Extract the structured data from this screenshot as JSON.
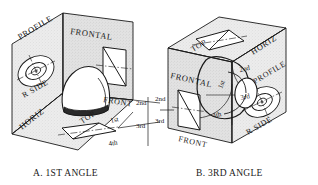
{
  "figure": {
    "type": "technical-drawing",
    "colors": {
      "line": "#1a1a1a",
      "face_fill": "#e8e8e8",
      "face_fill_dark": "#dcdcdc",
      "object_fill": "#ffffff",
      "object_shadow": "#2a2a2a",
      "background": "#ffffff"
    }
  },
  "panel_a": {
    "caption": "A. 1ST ANGLE",
    "plane_labels": {
      "profile": "PROFILE",
      "frontal": "FRONTAL",
      "horizontal": "HORIZ"
    },
    "view_labels": {
      "right_side": "R SIDE",
      "front": "FRONT",
      "top": "TOP"
    },
    "quadrant_labels": {
      "first": "1st",
      "second": "2nd",
      "third": "3rd",
      "fourth": "4th"
    }
  },
  "panel_b": {
    "caption": "B. 3RD ANGLE",
    "plane_labels": {
      "frontal": "FRONTAL",
      "horizontal": "HORIZ",
      "profile": "PROFILE"
    },
    "view_labels": {
      "top": "TOP",
      "front": "FRONT",
      "right_side": "R SIDE"
    },
    "quadrant_labels": {
      "first": "1st",
      "second": "2nd",
      "third": "3rd",
      "fourth": "4th"
    }
  }
}
